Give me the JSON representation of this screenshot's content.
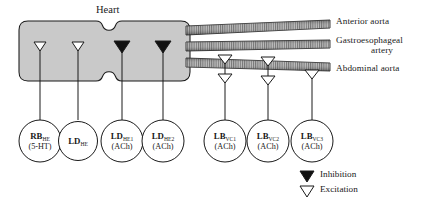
{
  "diagram": {
    "title": "Heart",
    "heart_fill": "#c9c9c9",
    "stroke": "#1a1a1a"
  },
  "vessels": [
    {
      "id": "anterior-aorta",
      "label": "Anterior aorta"
    },
    {
      "id": "gastroesophageal-artery",
      "label_line1": "Gastroesophageal",
      "label_line2": "artery"
    },
    {
      "id": "abdominal-aorta",
      "label": "Abdominal aorta"
    }
  ],
  "heart_synapses": [
    {
      "id": "syn-rb-he",
      "type": "excitation",
      "symbol": "open-triangle"
    },
    {
      "id": "syn-ld-he",
      "type": "excitation",
      "symbol": "open-triangle"
    },
    {
      "id": "syn-ld-he1",
      "type": "inhibition",
      "symbol": "filled-triangle"
    },
    {
      "id": "syn-ld-he2",
      "type": "inhibition",
      "symbol": "filled-triangle"
    }
  ],
  "aorta_synapses": [
    {
      "id": "syn-lb-vc1-upper",
      "type": "excitation",
      "symbol": "open-triangle"
    },
    {
      "id": "syn-lb-vc1-lower",
      "type": "excitation",
      "symbol": "open-triangle"
    },
    {
      "id": "syn-lb-vc2-upper",
      "type": "excitation",
      "symbol": "open-triangle"
    },
    {
      "id": "syn-lb-vc2-lower",
      "type": "excitation",
      "symbol": "open-triangle"
    },
    {
      "id": "syn-lb-vc3",
      "type": "excitation",
      "symbol": "open-triangle"
    }
  ],
  "neurons": [
    {
      "id": "rb-he",
      "name": "RB",
      "subscript": "HE",
      "transmitter": "(5-HT)"
    },
    {
      "id": "ld-he",
      "name": "LD",
      "subscript": "HE",
      "transmitter": ""
    },
    {
      "id": "ld-he1",
      "name": "LD",
      "subscript": "HE1",
      "transmitter": "(ACh)"
    },
    {
      "id": "ld-he2",
      "name": "LD",
      "subscript": "HE2",
      "transmitter": "(ACh)"
    },
    {
      "id": "lb-vc1",
      "name": "LB",
      "subscript": "VC1",
      "transmitter": "(ACh)"
    },
    {
      "id": "lb-vc2",
      "name": "LB",
      "subscript": "VC2",
      "transmitter": "(ACh)"
    },
    {
      "id": "lb-vc3",
      "name": "LB",
      "subscript": "VC3",
      "transmitter": "(ACh)"
    }
  ],
  "legend": {
    "items": [
      {
        "id": "legend-inhibition",
        "symbol": "filled-triangle",
        "label": "Inhibition"
      },
      {
        "id": "legend-excitation",
        "symbol": "open-triangle",
        "label": "Excitation"
      }
    ]
  }
}
